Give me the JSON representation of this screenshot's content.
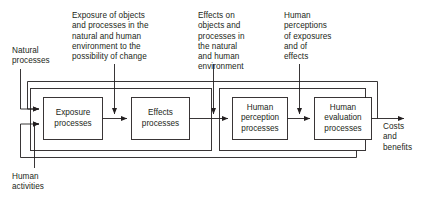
{
  "diagram": {
    "colors": {
      "stroke": "#231f20",
      "text": "#231f20",
      "background": "#ffffff"
    },
    "inputs": [
      {
        "id": "natural-processes",
        "label": "Natural\nprocesses"
      },
      {
        "id": "human-activities",
        "label": "Human\nactivities"
      }
    ],
    "annotations": [
      {
        "id": "exposure-annotation",
        "label": "Exposure of objects\nand processes in the\nnatural and human\nenvironment to the\npossibility of change"
      },
      {
        "id": "effects-annotation",
        "label": "Effects on\nobjects and\nprocesses in\nthe natural\nand human\nenvironment"
      },
      {
        "id": "perceptions-annotation",
        "label": "Human\nperceptions\nof exposures\nand of\neffects"
      }
    ],
    "process_boxes": [
      {
        "id": "exposure-processes",
        "label": "Exposure\nprocesses"
      },
      {
        "id": "effects-processes",
        "label": "Effects\nprocesses"
      },
      {
        "id": "human-perception-processes",
        "label": "Human\nperception\nprocesses"
      },
      {
        "id": "human-evaluation-processes",
        "label": "Human\nevaluation\nprocesses"
      }
    ],
    "outputs": [
      {
        "id": "costs-and-benefits",
        "label": "Costs\nand\nbenefits"
      }
    ]
  }
}
